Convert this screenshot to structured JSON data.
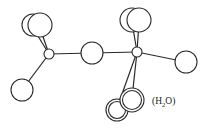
{
  "diagram": {
    "type": "molecular-structure",
    "label": {
      "open": "(H",
      "subscript": "2",
      "close": "O)"
    },
    "colors": {
      "line": "#2a2a2a",
      "fill": "#ffffff",
      "text": "#222222"
    }
  }
}
